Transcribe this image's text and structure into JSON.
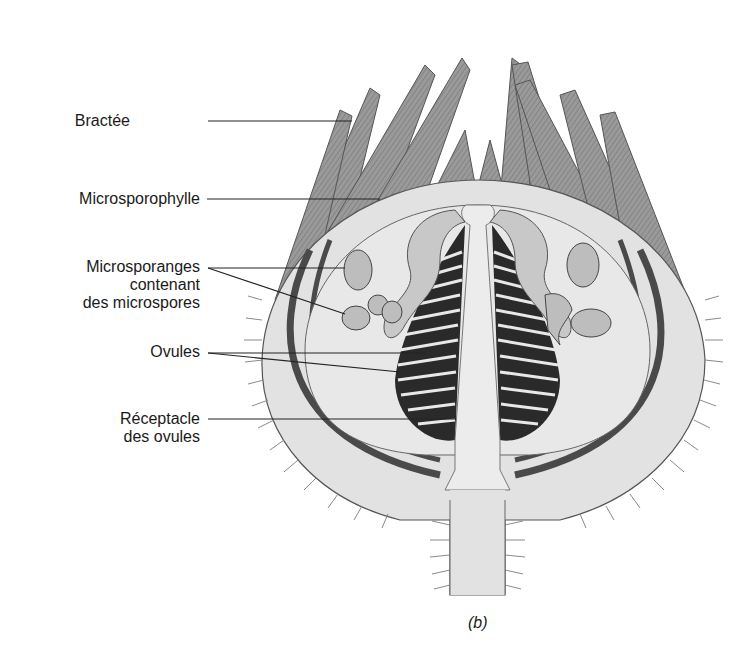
{
  "figure": {
    "caption": "(b)",
    "colors": {
      "background": "#ffffff",
      "tissue_light": "#e4e4e4",
      "tissue_mid": "#a8a8a8",
      "tissue_dark": "#4a4a4a",
      "leader_line": "#222222",
      "text": "#1a1a1a"
    }
  },
  "labels": [
    {
      "id": "bractee",
      "lines": [
        "Bractée"
      ]
    },
    {
      "id": "microsporophylle",
      "lines": [
        "Microsporophylle"
      ]
    },
    {
      "id": "microsporanges",
      "lines": [
        "Microsporanges",
        "contenant",
        "des microspores"
      ]
    },
    {
      "id": "ovules",
      "lines": [
        "Ovules"
      ]
    },
    {
      "id": "receptacle",
      "lines": [
        "Réceptacle",
        "des ovules"
      ]
    }
  ]
}
